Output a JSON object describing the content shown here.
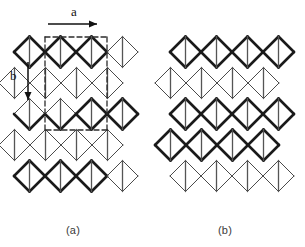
{
  "figure": {
    "kind": "lattice-diagram",
    "captions": [
      {
        "id": "a",
        "label": "(a)"
      },
      {
        "id": "b",
        "label": "(b)"
      }
    ],
    "vectors": [
      {
        "id": "a",
        "label": "a",
        "direction": "right",
        "arrow": "horizontal-right"
      },
      {
        "id": "b",
        "label": "b",
        "direction": "down",
        "arrow": "vertical-down"
      }
    ],
    "colors": {
      "bold_edge": "#1a1a1a",
      "thin_edge": "#4a4a4a",
      "vertical_edge": "#555555",
      "dashed_edge": "#2b2b2b",
      "background": "#ffffff",
      "caption_text": "#3a3a3a",
      "label_text": "#111111"
    },
    "geometry": {
      "cell_width": 31,
      "cell_height": 31,
      "row_offset_x": 15.5,
      "bold_stroke": 2.6,
      "thin_stroke": 1.0,
      "vertical_stroke": 1.3,
      "dash_pattern": "5,3"
    }
  },
  "chart_data": {
    "type": "diagram",
    "title": "",
    "panels": [
      {
        "id": "a",
        "label": "(a)",
        "origin": {
          "x": 14,
          "y": 52
        },
        "rows": [
          {
            "index": 0,
            "x0": 14,
            "y": 52,
            "diamonds": 4,
            "style": "bold-left-thin-right"
          },
          {
            "index": 1,
            "x0": 0,
            "y": 83,
            "diamonds": 4,
            "style": "thin"
          },
          {
            "index": 2,
            "x0": 14,
            "y": 114,
            "diamonds": 4,
            "style": "mixed"
          },
          {
            "index": 3,
            "x0": 0,
            "y": 145,
            "diamonds": 4,
            "style": "thin"
          },
          {
            "index": 4,
            "x0": 14,
            "y": 176,
            "diamonds": 4,
            "style": "bold-left-thin-right"
          }
        ],
        "unit_cell": {
          "style": "dashed",
          "corners": [
            [
              45,
              37
            ],
            [
              107,
              37
            ],
            [
              107,
              130
            ],
            [
              45,
              130
            ]
          ]
        }
      },
      {
        "id": "b",
        "label": "(b)",
        "origin": {
          "x": 170,
          "y": 52
        },
        "rows": [
          {
            "index": 0,
            "x0": 170,
            "y": 52,
            "diamonds": 4,
            "style": "bold"
          },
          {
            "index": 1,
            "x0": 155,
            "y": 83,
            "diamonds": 4,
            "style": "thin"
          },
          {
            "index": 2,
            "x0": 170,
            "y": 114,
            "diamonds": 4,
            "style": "bold"
          },
          {
            "index": 3,
            "x0": 155,
            "y": 145,
            "diamonds": 4,
            "style": "bold"
          },
          {
            "index": 4,
            "x0": 170,
            "y": 176,
            "diamonds": 4,
            "style": "thin"
          }
        ]
      }
    ],
    "annotations": [
      {
        "text": "a",
        "x": 71,
        "y": 10,
        "kind": "lattice-vector-label"
      },
      {
        "text": "b",
        "x": 12,
        "y": 74,
        "kind": "lattice-vector-label"
      },
      {
        "text": "(a)",
        "x": 70,
        "y": 230,
        "kind": "panel-caption"
      },
      {
        "text": "(b)",
        "x": 222,
        "y": 230,
        "kind": "panel-caption"
      }
    ]
  }
}
